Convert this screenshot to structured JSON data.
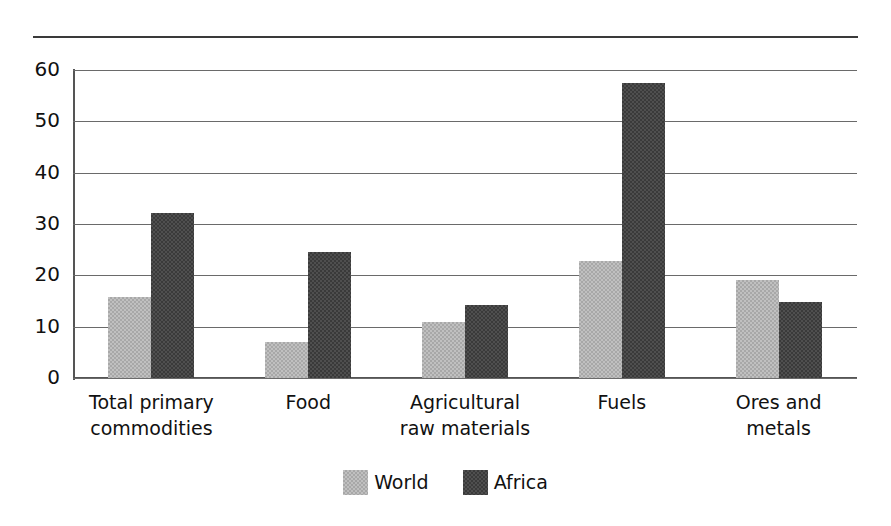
{
  "chart_data": {
    "type": "bar",
    "title": "",
    "subtitle": "",
    "xlabel": "",
    "ylabel": "",
    "ylim": [
      0,
      60
    ],
    "yticks": [
      0,
      10,
      20,
      30,
      40,
      50,
      60
    ],
    "grid": true,
    "legend_position": "bottom-center",
    "categories": [
      "Total primary\ncommodities",
      "Food",
      "Agricultural\nraw materials",
      "Fuels",
      "Ores and\nmetals"
    ],
    "series": [
      {
        "name": "World",
        "color": "#c0c0c0",
        "values": [
          15.8,
          7.0,
          11.0,
          22.7,
          19.0
        ]
      },
      {
        "name": "Africa",
        "color": "#4f4f4f",
        "values": [
          32.2,
          24.5,
          14.2,
          57.5,
          14.9
        ]
      }
    ]
  },
  "axis": {
    "tick_labels": [
      "60",
      "50",
      "40",
      "30",
      "20",
      "10",
      "0"
    ]
  },
  "legend": {
    "items": [
      {
        "label": "World",
        "color": "#c0c0c0"
      },
      {
        "label": "Africa",
        "color": "#4f4f4f"
      }
    ]
  },
  "colors": {
    "world": "#c0c0c0",
    "africa": "#4f4f4f",
    "gridline": "#6a6a6a",
    "axis": "#555555",
    "rule": "#3a3a3a",
    "text": "#111111",
    "background": "#ffffff"
  }
}
